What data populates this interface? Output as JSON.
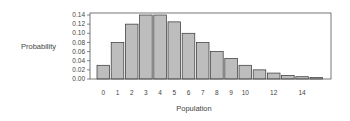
{
  "chart_data": {
    "type": "bar",
    "title": "",
    "xlabel": "Population",
    "ylabel": "Probability",
    "categories": [
      "0",
      "1",
      "2",
      "3",
      "4",
      "5",
      "6",
      "7",
      "8",
      "9",
      "10",
      "11",
      "12",
      "13",
      "14",
      "15"
    ],
    "values": [
      0.03,
      0.08,
      0.12,
      0.14,
      0.14,
      0.125,
      0.1,
      0.08,
      0.06,
      0.045,
      0.03,
      0.02,
      0.013,
      0.008,
      0.005,
      0.003
    ],
    "x_tick_labels": [
      {
        "index": 0,
        "label": "0"
      },
      {
        "index": 1,
        "label": "1"
      },
      {
        "index": 2,
        "label": "2"
      },
      {
        "index": 3,
        "label": "3"
      },
      {
        "index": 4,
        "label": "4"
      },
      {
        "index": 5,
        "label": "5"
      },
      {
        "index": 6,
        "label": "6"
      },
      {
        "index": 7,
        "label": "7"
      },
      {
        "index": 8,
        "label": "8"
      },
      {
        "index": 9,
        "label": "9"
      },
      {
        "index": 10,
        "label": "10"
      },
      {
        "index": 12,
        "label": "12"
      },
      {
        "index": 14,
        "label": "14"
      }
    ],
    "y_ticks": [
      "0.00",
      "0.02",
      "0.04",
      "0.06",
      "0.08",
      "0.10",
      "0.12",
      "0.14"
    ],
    "ylim": [
      0,
      0.14
    ],
    "grid": false,
    "legend": null,
    "colors": {
      "bar_fill": "#bdbdbd",
      "bar_stroke": "#333333",
      "frame": "#555555"
    }
  }
}
